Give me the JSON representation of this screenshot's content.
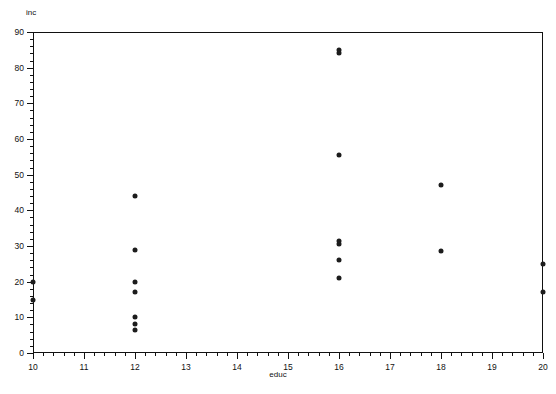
{
  "chart_data": {
    "type": "scatter",
    "title": "",
    "xlabel": "educ",
    "ylabel": "inc",
    "xlim": [
      10,
      20
    ],
    "ylim": [
      0,
      90
    ],
    "grid": false,
    "legend": null,
    "x_major_ticks": [
      10,
      11,
      12,
      13,
      14,
      15,
      16,
      17,
      18,
      19,
      20
    ],
    "y_major_ticks": [
      0,
      10,
      20,
      30,
      40,
      50,
      60,
      70,
      80,
      90
    ],
    "x_minor_step": 0.2,
    "y_minor_step": 2,
    "x_tick_labels": [
      "10",
      "11",
      "12",
      "13",
      "14",
      "15",
      "16",
      "17",
      "18",
      "19",
      "20"
    ],
    "y_tick_labels": [
      "0",
      "10",
      "20",
      "30",
      "40",
      "50",
      "60",
      "70",
      "80",
      "90"
    ],
    "marker": "filled-circle",
    "marker_color": "#1c1c1c",
    "points": [
      {
        "x": 10,
        "y": 20
      },
      {
        "x": 10,
        "y": 15
      },
      {
        "x": 12,
        "y": 44
      },
      {
        "x": 12,
        "y": 29
      },
      {
        "x": 12,
        "y": 20
      },
      {
        "x": 12,
        "y": 17
      },
      {
        "x": 12,
        "y": 10
      },
      {
        "x": 12,
        "y": 8
      },
      {
        "x": 12,
        "y": 6.5
      },
      {
        "x": 16,
        "y": 85
      },
      {
        "x": 16,
        "y": 84
      },
      {
        "x": 16,
        "y": 55.5
      },
      {
        "x": 16,
        "y": 31.5
      },
      {
        "x": 16,
        "y": 30.5
      },
      {
        "x": 16,
        "y": 26
      },
      {
        "x": 16,
        "y": 21
      },
      {
        "x": 18,
        "y": 47
      },
      {
        "x": 18,
        "y": 28.5
      },
      {
        "x": 20,
        "y": 25
      },
      {
        "x": 20,
        "y": 17
      }
    ]
  }
}
